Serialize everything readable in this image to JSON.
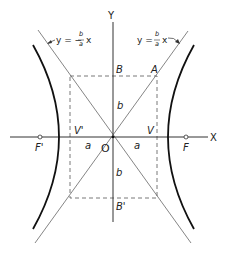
{
  "diagram": {
    "axes": {
      "x_label": "X",
      "y_label": "Y"
    },
    "points": {
      "origin": "O",
      "vertex_right": "V",
      "vertex_left": "V'",
      "focus_right": "F",
      "focus_left": "F'",
      "corner": "A",
      "top": "B",
      "bottom": "B'"
    },
    "segments": {
      "a_left": "a",
      "a_right": "a",
      "b_top": "b",
      "b_bottom": "b"
    },
    "asymptotes": {
      "negative": {
        "prefix": "y = −",
        "num": "b",
        "den": "a",
        "suffix": "x"
      },
      "positive": {
        "prefix": "y =",
        "num": "b",
        "den": "a",
        "suffix": "x"
      }
    }
  }
}
